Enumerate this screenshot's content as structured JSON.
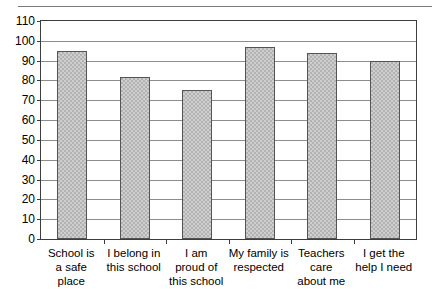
{
  "chart_data": {
    "type": "bar",
    "title": "",
    "subtitle": "",
    "xlabel": "",
    "ylabel": "",
    "categories": [
      "School is\na safe\nplace",
      "I belong in\nthis school",
      "I am\nproud of\nthis school",
      "My family is\nrespected",
      "Teachers\ncare\nabout me",
      "I get the\nhelp I need"
    ],
    "values": [
      95,
      82,
      75,
      97,
      94,
      90
    ],
    "ylim": [
      0,
      110
    ],
    "ytick_step": 10,
    "yticks": [
      0,
      10,
      20,
      30,
      40,
      50,
      60,
      70,
      80,
      90,
      100,
      110
    ],
    "ytick_labels": [
      "0",
      "10",
      "20",
      "30",
      "40",
      "50",
      "60",
      "70",
      "80",
      "90",
      "100",
      "110"
    ],
    "grid": true,
    "grid_axis": "y",
    "legend": false,
    "legend_position": "none",
    "bar_color": "#b3b3b3",
    "bar_edge_color": "#545454",
    "grid_color": "#8d8d8d",
    "axis_color": "#3d3d3d",
    "background_color": "#ffffff"
  },
  "figure": {
    "top_rule": true
  }
}
